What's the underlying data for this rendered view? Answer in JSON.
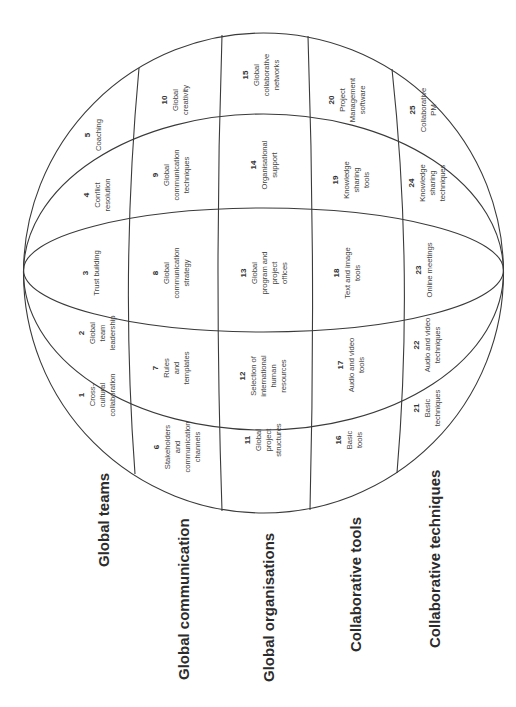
{
  "diagram": {
    "type": "segmented-sphere",
    "orientation": "rotated-90-ccw",
    "rows": [
      {
        "label": "Global teams",
        "cells": [
          {
            "num": "1",
            "lines": [
              "Cross-",
              "cultural",
              "collaboration"
            ]
          },
          {
            "num": "2",
            "lines": [
              "Global",
              "team",
              "leadership"
            ]
          },
          {
            "num": "3",
            "lines": [
              "Trust building"
            ]
          },
          {
            "num": "4",
            "lines": [
              "Conflict",
              "resolution"
            ]
          },
          {
            "num": "5",
            "lines": [
              "Coaching"
            ]
          }
        ]
      },
      {
        "label": "Global communication",
        "cells": [
          {
            "num": "6",
            "lines": [
              "Stakeholders",
              "and",
              "communication",
              "channels"
            ]
          },
          {
            "num": "7",
            "lines": [
              "Rules",
              "and",
              "templates"
            ]
          },
          {
            "num": "8",
            "lines": [
              "Global",
              "communication",
              "strategy"
            ]
          },
          {
            "num": "9",
            "lines": [
              "Global",
              "communication",
              "techniques"
            ]
          },
          {
            "num": "10",
            "lines": [
              "Global",
              "creativity"
            ]
          }
        ]
      },
      {
        "label": "Global organisations",
        "cells": [
          {
            "num": "11",
            "lines": [
              "Global",
              "project",
              "structures"
            ]
          },
          {
            "num": "12",
            "lines": [
              "Selection of",
              "international",
              "human",
              "resources"
            ]
          },
          {
            "num": "13",
            "lines": [
              "Global",
              "program and",
              "project",
              "offices"
            ]
          },
          {
            "num": "14",
            "lines": [
              "Organisational",
              "support"
            ]
          },
          {
            "num": "15",
            "lines": [
              "Global",
              "collaborative",
              "networks"
            ]
          }
        ]
      },
      {
        "label": "Collaborative tools",
        "cells": [
          {
            "num": "16",
            "lines": [
              "Basic",
              "tools"
            ]
          },
          {
            "num": "17",
            "lines": [
              "Audio and video",
              "tools"
            ]
          },
          {
            "num": "18",
            "lines": [
              "Text and image",
              "tools"
            ]
          },
          {
            "num": "19",
            "lines": [
              "Knowledge",
              "sharing",
              "tools"
            ]
          },
          {
            "num": "20",
            "lines": [
              "Project",
              "Management",
              "software"
            ]
          }
        ]
      },
      {
        "label": "Collaborative techniques",
        "cells": [
          {
            "num": "21",
            "lines": [
              "Basic",
              "techniques"
            ]
          },
          {
            "num": "22",
            "lines": [
              "Audio and video",
              "techniques"
            ]
          },
          {
            "num": "23",
            "lines": [
              "Online meetings"
            ]
          },
          {
            "num": "24",
            "lines": [
              "Knowledge",
              "sharing",
              "techniques"
            ]
          },
          {
            "num": "25",
            "lines": [
              "Collaborative",
              "PM"
            ]
          }
        ]
      }
    ]
  },
  "colors": {
    "line": "#3a3a3a",
    "text": "#444444",
    "label": "#2b2b2b",
    "background": "#ffffff"
  }
}
